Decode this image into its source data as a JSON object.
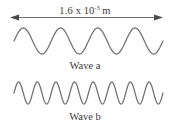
{
  "figure": {
    "background_color": "#ffffff",
    "stroke_color": "#707070",
    "text_color": "#3a3a3a",
    "width": 170,
    "height": 131
  },
  "dimension": {
    "icon_left": "left-arrowhead-icon",
    "icon_right": "right-arrowhead-icon",
    "value": "1.6",
    "times": "x",
    "base": "10",
    "exponent": "-3",
    "unit": "m",
    "full_text": "1.6 x 10-3 m",
    "span_start_px": 10,
    "span_end_px": 163
  },
  "waves": [
    {
      "label": "Wave a",
      "cycles": 4,
      "amplitude_px": 13,
      "center_y_px": 41,
      "x_start_px": 14,
      "x_end_px": 163,
      "wavelength_fraction_of_span": 0.25
    },
    {
      "label": "Wave b",
      "cycles": 8,
      "amplitude_px": 11,
      "center_y_px": 93,
      "x_start_px": 14,
      "x_end_px": 163,
      "wavelength_fraction_of_span": 0.125
    }
  ],
  "chart_data": {
    "type": "line",
    "title": "",
    "xlabel": "1.6 x 10-3 m",
    "ylabel": "",
    "grid": false,
    "legend_position": "below-each-curve",
    "annotations": [
      "1.6 x 10-3 m",
      "Wave a",
      "Wave b"
    ],
    "x_total_length": "1.6e-3 m",
    "series": [
      {
        "name": "Wave a",
        "cycles_over_span": 4,
        "wavelength": "4.0e-4 m",
        "relative_amplitude": 1.0
      },
      {
        "name": "Wave b",
        "cycles_over_span": 8,
        "wavelength": "2.0e-4 m",
        "relative_amplitude": 0.85
      }
    ]
  }
}
